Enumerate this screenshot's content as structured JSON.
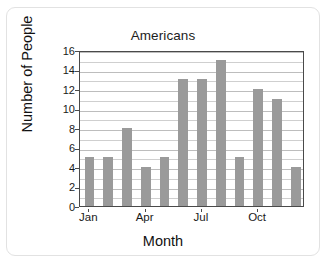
{
  "chart_data": {
    "type": "bar",
    "title": "Americans",
    "xlabel": "Month",
    "ylabel": "Number of People",
    "categories": [
      "Jan",
      "Feb",
      "Mar",
      "Apr",
      "May",
      "Jun",
      "Jul",
      "Aug",
      "Sep",
      "Oct",
      "Nov",
      "Dec"
    ],
    "values": [
      5,
      5,
      8,
      4,
      5,
      13,
      13,
      15,
      5,
      12,
      11,
      4
    ],
    "ylim": [
      0,
      16
    ],
    "y_ticks": [
      0,
      2,
      4,
      6,
      8,
      10,
      12,
      14,
      16
    ],
    "y_tick_labels": [
      "0",
      "2",
      "4",
      "6",
      "8",
      "10",
      "12",
      "14",
      "16"
    ],
    "y_minor_ticks": [
      1,
      3,
      5,
      7,
      9,
      11,
      13,
      15
    ],
    "x_tick_labels": [
      "Jan",
      "Apr",
      "Jul",
      "Oct"
    ],
    "x_tick_categories": [
      "Jan",
      "Apr",
      "Jul",
      "Oct"
    ],
    "grid": true,
    "grid_axis": "y",
    "legend": false,
    "bar_color": "#9a9a9a",
    "axis_color": "#4a4a4a",
    "grid_color": "#cfcfcf",
    "background_color": "#ffffff"
  }
}
